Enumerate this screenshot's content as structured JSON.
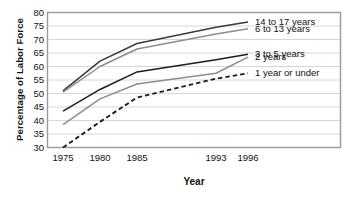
{
  "chart_data": {
    "type": "line",
    "title": "",
    "xlabel": "Year",
    "ylabel": "Percentage of Labor Force",
    "x": [
      1975,
      1980,
      1985,
      1993,
      1996
    ],
    "xtick_labels": [
      "1975",
      "1980",
      "1985",
      "1993",
      "1996"
    ],
    "ytick_labels": [
      "80",
      "75",
      "70",
      "65",
      "60",
      "55",
      "50",
      "45",
      "40",
      "35",
      "30"
    ],
    "ylim": [
      30,
      80
    ],
    "ytick_step": 5,
    "grid": true,
    "legend_position": "right-of-line-ends",
    "series": [
      {
        "name": "14 to 17 years",
        "values": [
          51,
          62,
          68.5,
          74.5,
          76.5
        ],
        "style": "solid",
        "color": "#3a3a3a"
      },
      {
        "name": "6 to 13 years",
        "values": [
          50.5,
          60,
          66.5,
          72,
          74
        ],
        "style": "solid",
        "color": "#8d8d8d"
      },
      {
        "name": "3 to 5 years",
        "values": [
          43.5,
          51.5,
          58,
          62.5,
          64.5
        ],
        "style": "solid",
        "color": "#1d1d1d"
      },
      {
        "name": "2 years",
        "values": [
          38.5,
          48,
          53.5,
          57.5,
          63.5
        ],
        "style": "solid",
        "color": "#8d8d8d"
      },
      {
        "name": "1 year or under",
        "values": [
          30,
          39.5,
          48.5,
          55.5,
          57.5
        ],
        "style": "dashed",
        "color": "#1d1d1d"
      }
    ]
  },
  "axes": {
    "frame_color": "#9a9a9a",
    "grid_color": "#d6d6d6"
  }
}
